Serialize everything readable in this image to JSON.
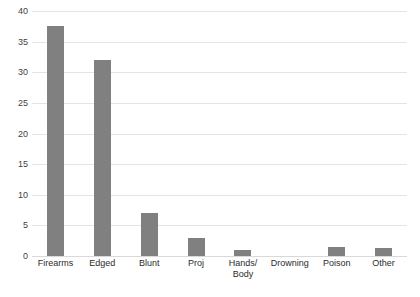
{
  "chart_data": {
    "type": "bar",
    "title": "",
    "subtitle": "",
    "xlabel": "",
    "ylabel": "",
    "categories": [
      "Firearms",
      "Edged",
      "Blunt",
      "Proj",
      "Hands/\nBody",
      "Drowning",
      "Poison",
      "Other"
    ],
    "values": [
      37.5,
      32,
      7,
      3,
      1,
      0,
      1.5,
      1.3
    ],
    "ylim": [
      0,
      40
    ],
    "yticks": [
      0,
      5,
      10,
      15,
      20,
      25,
      30,
      35,
      40
    ],
    "ytick_labels": [
      "0",
      "5",
      "10",
      "15",
      "20",
      "25",
      "30",
      "35",
      "40"
    ],
    "grid": true,
    "legend": false,
    "legend_position": "none",
    "series": [
      {
        "name": "",
        "values": [
          37.5,
          32,
          7,
          3,
          1,
          0,
          1.5,
          1.3
        ]
      }
    ]
  },
  "style": {
    "bar_color": "#808080",
    "gridline_color": "#e4e4e4",
    "baseline_color": "#d9d9d9",
    "background": "#ffffff",
    "tick_label_color": "#3f3f3f",
    "category_label_color": "#2b2b2b"
  }
}
